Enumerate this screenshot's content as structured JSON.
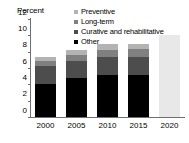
{
  "chart_data": {
    "type": "bar",
    "title": "",
    "subtitle": "",
    "xlabel": "",
    "ylabel": "Percent",
    "categories": [
      "2000",
      "2005",
      "2010",
      "2015",
      "2020"
    ],
    "ylim": [
      0,
      12
    ],
    "yticks": [
      0,
      2,
      4,
      6,
      8,
      10,
      12
    ],
    "ytick_labels": [
      "0",
      "2",
      "4",
      "6",
      "8",
      "10",
      "12"
    ],
    "grid": false,
    "stacked": true,
    "legend_position": "top-right",
    "series": [
      {
        "name": "Other",
        "color": "#000000",
        "values": [
          4.1,
          4.8,
          5.2,
          5.1,
          null
        ]
      },
      {
        "name": "Curative and rehabilitative",
        "color": "#4d4d4d",
        "values": [
          2.1,
          2.1,
          2.2,
          2.3,
          null
        ]
      },
      {
        "name": "Long-term",
        "color": "#808080",
        "values": [
          0.7,
          0.7,
          0.8,
          0.9,
          null
        ]
      },
      {
        "name": "Preventive",
        "color": "#b3b3b3",
        "values": [
          0.5,
          0.6,
          0.7,
          0.7,
          null
        ]
      }
    ],
    "totals": [
      7.4,
      8.2,
      8.9,
      9.0,
      10.0
    ],
    "projection": {
      "category": "2020",
      "value": 10.0,
      "color": "#e8e8e8"
    },
    "axis_color": "#6f6f6f"
  },
  "legend": {
    "items": [
      {
        "label": "Preventive",
        "color": "#b3b3b3"
      },
      {
        "label": "Long-term",
        "color": "#808080"
      },
      {
        "label": "Curative and rehabilitative",
        "color": "#4d4d4d"
      },
      {
        "label": "Other",
        "color": "#000000"
      }
    ]
  }
}
